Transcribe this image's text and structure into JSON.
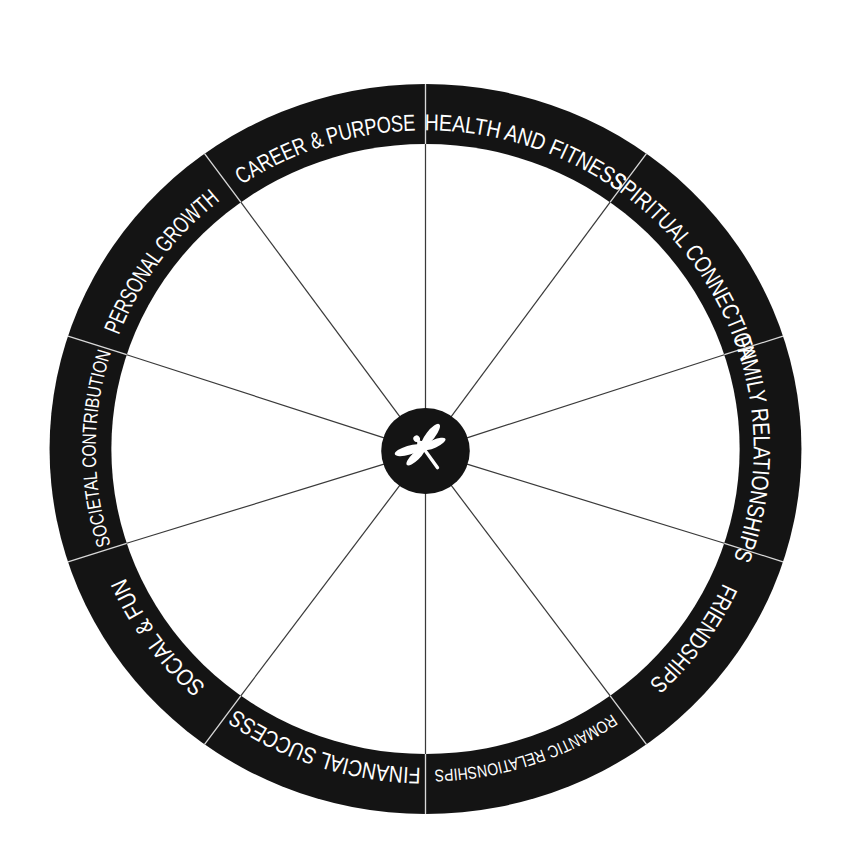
{
  "diagram": {
    "center": {
      "icon": "dragonfly-icon"
    },
    "colors": {
      "ring": "#141414",
      "background": "#ffffff",
      "label": "#ffffff",
      "spoke": "#3a3a3a",
      "divider": "#d8d8d8"
    },
    "segments": [
      {
        "label": "HEALTH AND FITNESS",
        "start_deg": 0,
        "end_deg": 36
      },
      {
        "label": "SPIRITUAL CONNECTION",
        "start_deg": 36,
        "end_deg": 72
      },
      {
        "label": "FAMILY RELATIONSHIPS",
        "start_deg": 72,
        "end_deg": 108
      },
      {
        "label": "FRIENDSHIPS",
        "start_deg": 108,
        "end_deg": 144
      },
      {
        "label": "ROMANTIC RELATIONSHIPS",
        "start_deg": 144,
        "end_deg": 180
      },
      {
        "label": "FINANCIAL SUCCESS",
        "start_deg": 180,
        "end_deg": 216
      },
      {
        "label": "SOCIAL & FUN",
        "start_deg": 216,
        "end_deg": 252
      },
      {
        "label": "SOCIETAL CONTRIBUTION",
        "start_deg": 252,
        "end_deg": 288
      },
      {
        "label": "PERSONAL GROWTH",
        "start_deg": 288,
        "end_deg": 324
      },
      {
        "label": "CAREER & PURPOSE",
        "start_deg": 324,
        "end_deg": 360
      }
    ]
  }
}
